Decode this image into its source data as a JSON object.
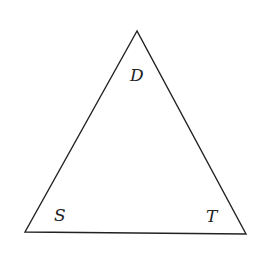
{
  "diagram": {
    "type": "triangle",
    "stroke_color": "#222222",
    "vertices": {
      "top": {
        "label": "D",
        "x": 137,
        "y": 31
      },
      "bottom_left": {
        "label": "S",
        "x": 25,
        "y": 232
      },
      "bottom_right": {
        "label": "T",
        "x": 246,
        "y": 234
      }
    },
    "labels": {
      "top": "D",
      "bottom_left": "S",
      "bottom_right": "T"
    }
  }
}
